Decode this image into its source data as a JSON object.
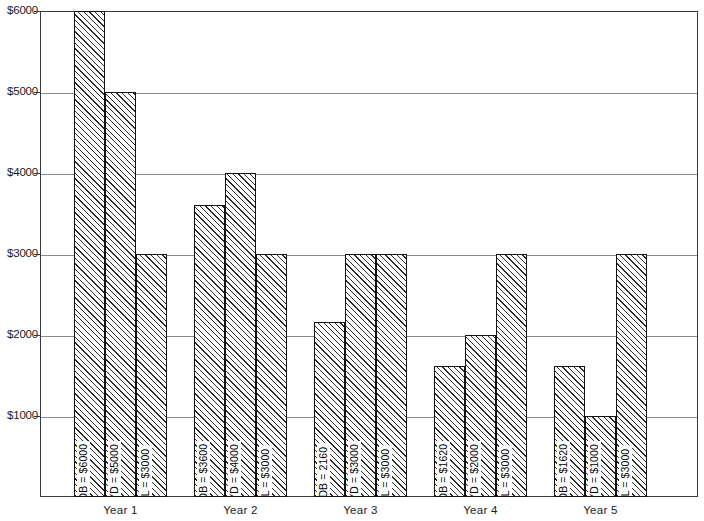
{
  "chart_data": {
    "type": "bar",
    "title": "",
    "subtitle": "",
    "xlabel": "",
    "ylabel": "",
    "categories": [
      "Year 1",
      "Year 2",
      "Year 3",
      "Year 4",
      "Year 5"
    ],
    "series": [
      {
        "name": "DDB",
        "values": [
          6000,
          3600,
          2160,
          1620,
          1620
        ]
      },
      {
        "name": "SYD",
        "values": [
          5000,
          4000,
          3000,
          2000,
          1000
        ]
      },
      {
        "name": "SL",
        "values": [
          3000,
          3000,
          3000,
          3000,
          3000
        ]
      }
    ],
    "bar_labels": [
      [
        "DDB = $6000",
        "SYD = $5000",
        "SL = $3000"
      ],
      [
        "DDB = $3600",
        "SYD = $4000",
        "SL = $3000"
      ],
      [
        "DDB = 2160",
        "SYD = $3000",
        "SL = $3000"
      ],
      [
        "DDB = $1620",
        "SYD = $2000",
        "SL = $3000"
      ],
      [
        "DDB = $1620",
        "SYD = $1000",
        "SL = $3000"
      ]
    ],
    "ylim": [
      0,
      6000
    ],
    "yticks": [
      1000,
      2000,
      3000,
      4000,
      5000,
      6000
    ],
    "ytick_labels": [
      "$1000",
      "$2000",
      "$3000",
      "$4000",
      "$5000",
      "$6000"
    ],
    "grid": true,
    "legend": "none",
    "bar_fill": "diagonal-hatch",
    "colors": {
      "axis": "#3a3a3a",
      "grid": "#8a8a8a",
      "bar_outline": "#111111",
      "hatch": "#2b2b2b",
      "background": "#ffffff",
      "text": "#1a1a1a"
    }
  }
}
